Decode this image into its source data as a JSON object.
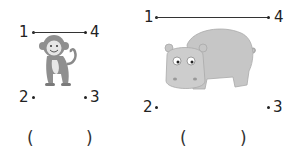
{
  "figures": [
    {
      "animal": "monkey",
      "labels": {
        "p1": "1",
        "p2": "2",
        "p3": "3",
        "p4": "4"
      },
      "answer": {
        "open": "(",
        "close": ")",
        "value": ""
      }
    },
    {
      "animal": "hippo",
      "labels": {
        "p1": "1",
        "p2": "2",
        "p3": "3",
        "p4": "4"
      },
      "answer": {
        "open": "(",
        "close": ")",
        "value": ""
      }
    }
  ],
  "colors": {
    "ink": "#222222",
    "animal_gray": "#9a9a9a",
    "hippo_gray": "#c4c4c4"
  }
}
